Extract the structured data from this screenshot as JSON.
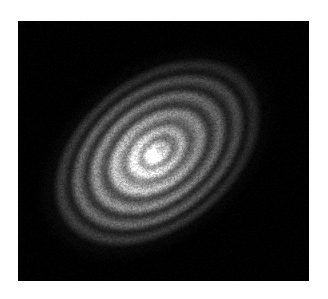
{
  "page": {
    "width": 328,
    "height": 299,
    "background_color": "#ffffff"
  },
  "image_field": {
    "x": 18,
    "y": 21,
    "width": 291,
    "height": 260,
    "background_color": "#000000",
    "colormap": "grayscale",
    "colormap_low": "#000000",
    "colormap_high": "#ffffff"
  },
  "chart_data": {
    "type": "heatmap",
    "title": "",
    "subtitle": "",
    "xlabel": "",
    "ylabel": "",
    "grid": false,
    "legend": "none",
    "axes_visible": false,
    "tick_labels_x": [],
    "tick_labels_y": [],
    "colorbar": false,
    "field_extent_px": {
      "x0": 0,
      "y0": 0,
      "x1": 291,
      "y1": 260
    },
    "disk": {
      "center_x": 139,
      "center_y": 131,
      "position_angle_deg": -38,
      "axis_ratio": 0.66,
      "inclination_deg": 48,
      "outer_radius_px": 118,
      "peak_intensity": 1.0,
      "background_intensity": 0.0,
      "noise_amplitude": 0.035,
      "brightness_asymmetry": {
        "brighter_side_deg": 142,
        "amplitude": 0.22
      }
    },
    "radial_profile": [
      {
        "name": "core",
        "radius_px": 0,
        "intensity": 1.0,
        "kind": "peak"
      },
      {
        "name": "core",
        "radius_px": 9,
        "intensity": 0.95,
        "kind": "peak"
      },
      {
        "name": "gap-1",
        "radius_px": 18,
        "intensity": 0.52,
        "kind": "gap"
      },
      {
        "name": "ring-1",
        "radius_px": 27,
        "intensity": 0.8,
        "kind": "ring"
      },
      {
        "name": "gap-2",
        "radius_px": 37,
        "intensity": 0.4,
        "kind": "gap"
      },
      {
        "name": "ring-2",
        "radius_px": 48,
        "intensity": 0.62,
        "kind": "ring"
      },
      {
        "name": "gap-3",
        "radius_px": 59,
        "intensity": 0.22,
        "kind": "gap"
      },
      {
        "name": "ring-3",
        "radius_px": 70,
        "intensity": 0.44,
        "kind": "ring"
      },
      {
        "name": "gap-4",
        "radius_px": 80,
        "intensity": 0.14,
        "kind": "gap"
      },
      {
        "name": "ring-4",
        "radius_px": 90,
        "intensity": 0.3,
        "kind": "ring"
      },
      {
        "name": "gap-5",
        "radius_px": 100,
        "intensity": 0.08,
        "kind": "gap"
      },
      {
        "name": "ring-5",
        "radius_px": 108,
        "intensity": 0.16,
        "kind": "ring"
      },
      {
        "name": "outer-edge",
        "radius_px": 120,
        "intensity": 0.02,
        "kind": "edge"
      },
      {
        "name": "background",
        "radius_px": 140,
        "intensity": 0.0,
        "kind": "sky"
      }
    ]
  }
}
